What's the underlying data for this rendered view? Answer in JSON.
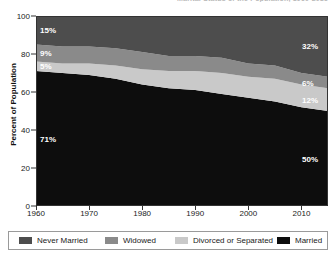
{
  "chart_title": "Marital Status of the Population, 1960-2015",
  "axes": {
    "ylabel": "Percent of Population",
    "yticks": [
      "0",
      "20",
      "40",
      "60",
      "80",
      "100"
    ],
    "xticks": [
      "1960",
      "1970",
      "1980",
      "1990",
      "2000",
      "2010"
    ]
  },
  "legend": {
    "items": [
      {
        "label": "Never Married",
        "color": "#4d4d4d"
      },
      {
        "label": "Widowed",
        "color": "#8a8a8a"
      },
      {
        "label": "Divorced or Separated",
        "color": "#c9c9c9"
      },
      {
        "label": "Married",
        "color": "#0d0d0d"
      }
    ]
  },
  "callouts": {
    "left": [
      {
        "name": "never-married-1960",
        "value": "15%"
      },
      {
        "name": "widowed-1960",
        "value": "9%"
      },
      {
        "name": "divorced-1960",
        "value": "5%"
      },
      {
        "name": "married-1960",
        "value": "71%"
      }
    ],
    "right": [
      {
        "name": "never-married-2015",
        "value": "32%"
      },
      {
        "name": "widowed-2015",
        "value": "6%"
      },
      {
        "name": "divorced-2015",
        "value": "12%"
      },
      {
        "name": "married-2015",
        "value": "50%"
      }
    ]
  },
  "chart_data": {
    "type": "area",
    "title": "Marital Status of the Population, 1960-2015",
    "xlabel": "",
    "ylabel": "Percent of Population",
    "xlim": [
      1960,
      2015
    ],
    "ylim": [
      0,
      100
    ],
    "grid": false,
    "stacked": true,
    "legend_position": "bottom",
    "x": [
      1960,
      1965,
      1970,
      1975,
      1980,
      1985,
      1990,
      1995,
      2000,
      2005,
      2010,
      2015
    ],
    "series": [
      {
        "name": "Married",
        "color": "#0d0d0d",
        "values": [
          71,
          70,
          69,
          67,
          64,
          62,
          61,
          59,
          57,
          55,
          52,
          50
        ]
      },
      {
        "name": "Divorced or Separated",
        "color": "#c9c9c9",
        "values": [
          5,
          5,
          6,
          7,
          8,
          9,
          10,
          11,
          11,
          12,
          12,
          12
        ]
      },
      {
        "name": "Widowed",
        "color": "#8a8a8a",
        "values": [
          9,
          9,
          9,
          9,
          9,
          8,
          8,
          8,
          7,
          7,
          6,
          6
        ]
      },
      {
        "name": "Never Married",
        "color": "#4d4d4d",
        "values": [
          15,
          16,
          16,
          17,
          19,
          21,
          21,
          22,
          25,
          26,
          30,
          32
        ]
      }
    ],
    "annotations": [
      {
        "text": "15%",
        "x": 1960,
        "series": "Never Married"
      },
      {
        "text": "9%",
        "x": 1960,
        "series": "Widowed"
      },
      {
        "text": "5%",
        "x": 1960,
        "series": "Divorced or Separated"
      },
      {
        "text": "71%",
        "x": 1960,
        "series": "Married"
      },
      {
        "text": "32%",
        "x": 2015,
        "series": "Never Married"
      },
      {
        "text": "6%",
        "x": 2015,
        "series": "Widowed"
      },
      {
        "text": "12%",
        "x": 2015,
        "series": "Divorced or Separated"
      },
      {
        "text": "50%",
        "x": 2015,
        "series": "Married"
      }
    ]
  }
}
